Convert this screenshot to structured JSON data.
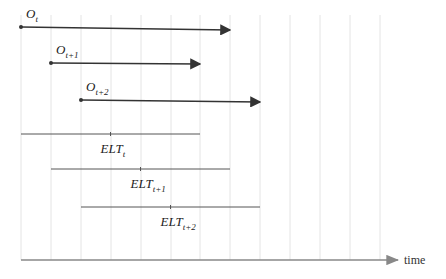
{
  "diagram": {
    "axis_label": "time",
    "grid_x": [
      21,
      51,
      81,
      111,
      141,
      171,
      200,
      230,
      260,
      290,
      320,
      350,
      380
    ],
    "observations": [
      {
        "label": "O",
        "sub": "t",
        "x1": 21,
        "y1": 27,
        "x2": 230,
        "y2": 30
      },
      {
        "label": "O",
        "sub": "t+1",
        "x1": 51,
        "y1": 63,
        "x2": 200,
        "y2": 64
      },
      {
        "label": "O",
        "sub": "t+2",
        "x1": 81,
        "y1": 100,
        "x2": 260,
        "y2": 102
      }
    ],
    "elts": [
      {
        "label": "ELT",
        "sub": "t",
        "x1": 21,
        "x2": 200,
        "y": 134
      },
      {
        "label": "ELT",
        "sub": "t+1",
        "x1": 51,
        "x2": 230,
        "y": 169
      },
      {
        "label": "ELT",
        "sub": "t+2",
        "x1": 81,
        "x2": 260,
        "y": 207
      }
    ],
    "colors": {
      "arrow": "#333333",
      "grid": "#dddddd",
      "axis": "#888888"
    }
  }
}
